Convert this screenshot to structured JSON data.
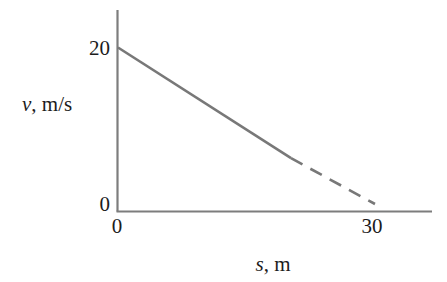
{
  "figure": {
    "background_color": "#ffffff",
    "line_color": "#787878",
    "axis_color": "#7d7d7d",
    "text_color": "#1c1c1c"
  },
  "axes": {
    "y": {
      "title_var": "v",
      "title_sep": ", ",
      "title_unit": "m/s",
      "title_full": "v, m/s",
      "ticks": [
        {
          "label": "0",
          "value": 0
        },
        {
          "label": "20",
          "value": 20
        }
      ]
    },
    "x": {
      "title_var": "s",
      "title_sep": ", ",
      "title_unit": "m",
      "title_full": "s, m",
      "ticks": [
        {
          "label": "0",
          "value": 0
        },
        {
          "label": "30",
          "value": 30
        }
      ]
    }
  },
  "chart_data": {
    "type": "line",
    "title": "",
    "xlabel": "s, m",
    "ylabel": "v, m/s",
    "xlim": [
      0,
      44.5
    ],
    "ylim": [
      0,
      23
    ],
    "grid": false,
    "legend": null,
    "series": [
      {
        "name": "v(s)",
        "style": "solid-then-dashed",
        "color": "#787878",
        "x": [
          0,
          30
        ],
        "y": [
          20,
          0
        ],
        "solid_segment": {
          "x": [
            0,
            20.2
          ],
          "y": [
            20,
            6.5
          ]
        },
        "dashed_segment": {
          "x": [
            20.2,
            30
          ],
          "y": [
            6.5,
            0
          ]
        },
        "slope": -0.6667,
        "intercept": 20
      }
    ],
    "annotations": []
  }
}
